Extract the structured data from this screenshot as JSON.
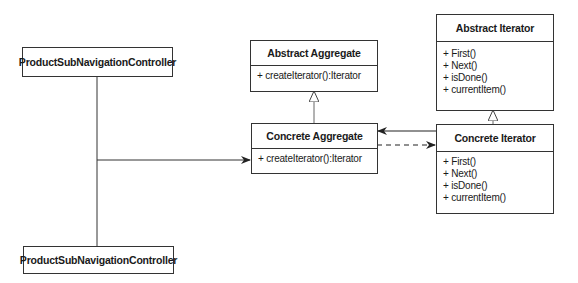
{
  "nodes": {
    "controller_top": {
      "label": "ProductSubNavigationController"
    },
    "controller_bottom": {
      "label": "ProductSubNavigationController"
    },
    "abstract_aggregate": {
      "title": "Abstract Aggregate",
      "operations": [
        "+ createIterator():Iterator"
      ]
    },
    "concrete_aggregate": {
      "title": "Concrete Aggregate",
      "operations": [
        "+ createIterator():Iterator"
      ]
    },
    "abstract_iterator": {
      "title": "Abstract Iterator",
      "operations": [
        "+ First()",
        "+ Next()",
        "+ isDone()",
        "+ currentItem()"
      ]
    },
    "concrete_iterator": {
      "title": "Concrete Iterator",
      "operations": [
        "+ First()",
        "+ Next()",
        "+ isDone()",
        "+ currentItem()"
      ]
    }
  },
  "edges": [
    {
      "from": "controller_top",
      "to": "concrete_aggregate",
      "type": "association"
    },
    {
      "from": "controller_bottom",
      "to": "concrete_aggregate",
      "type": "association"
    },
    {
      "from": "concrete_aggregate",
      "to": "abstract_aggregate",
      "type": "generalization"
    },
    {
      "from": "concrete_iterator",
      "to": "abstract_iterator",
      "type": "generalization"
    },
    {
      "from": "concrete_iterator",
      "to": "concrete_aggregate",
      "type": "association"
    },
    {
      "from": "concrete_aggregate",
      "to": "concrete_iterator",
      "type": "dependency"
    }
  ]
}
